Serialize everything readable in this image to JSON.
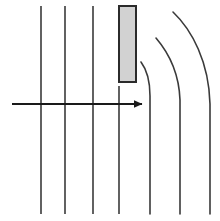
{
  "figure": {
    "width": 220,
    "height": 221,
    "background_color": "#ffffff",
    "line_color": "#3a3a3a",
    "line_width": 1.6
  },
  "plate": {
    "label": "obstacle-plate",
    "x": 119,
    "y": 6,
    "width": 17,
    "height": 76,
    "fill_color": "#d2d2d2",
    "stroke_color": "#2b2b2b",
    "stroke_width": 2
  },
  "flow_arrow": {
    "label": "flow-direction-arrow",
    "x1": 12,
    "y1": 104,
    "x2": 142,
    "y2": 104,
    "color": "#1a1a1a",
    "stroke_width": 1.8,
    "head_length": 9,
    "head_width": 8
  },
  "straight_streamlines": [
    {
      "name": "streamline-1",
      "x": 41,
      "y_top": 6,
      "y_bottom": 214
    },
    {
      "name": "streamline-2",
      "x": 65,
      "y_top": 6,
      "y_bottom": 214
    },
    {
      "name": "streamline-3",
      "x": 93,
      "y_top": 6,
      "y_bottom": 214
    },
    {
      "name": "streamline-4",
      "x": 119,
      "y_top": 86,
      "y_bottom": 214
    }
  ],
  "curved_streamlines": [
    {
      "name": "curved-streamline-1",
      "path": "M 141 62 C 147 70, 150 82, 150 96 L 150 214",
      "start_x": 141,
      "start_y": 62,
      "end_x": 150,
      "end_y": 214
    },
    {
      "name": "curved-streamline-2",
      "path": "M 156 38 C 168 52, 179 72, 180 100 L 180 214",
      "start_x": 156,
      "start_y": 38,
      "end_x": 180,
      "end_y": 214
    },
    {
      "name": "curved-streamline-3",
      "path": "M 173 12 C 192 30, 209 62, 210 104 L 210 214",
      "start_x": 173,
      "start_y": 12,
      "end_x": 210,
      "end_y": 214
    }
  ],
  "chart_data": {
    "type": "line",
    "xlabel": "",
    "ylabel": "",
    "xlim": [
      0,
      220
    ],
    "ylim": [
      221,
      0
    ],
    "grid": false,
    "legend": "none",
    "series": [
      {
        "name": "streamline-1",
        "x": [
          41,
          41
        ],
        "y": [
          6,
          214
        ]
      },
      {
        "name": "streamline-2",
        "x": [
          65,
          65
        ],
        "y": [
          6,
          214
        ]
      },
      {
        "name": "streamline-3",
        "x": [
          93,
          93
        ],
        "y": [
          6,
          214
        ]
      },
      {
        "name": "streamline-4",
        "x": [
          119,
          119
        ],
        "y": [
          86,
          214
        ]
      },
      {
        "name": "curved-streamline-1",
        "x": [
          141,
          146,
          150,
          150
        ],
        "y": [
          62,
          74,
          96,
          214
        ]
      },
      {
        "name": "curved-streamline-2",
        "x": [
          156,
          170,
          180,
          180
        ],
        "y": [
          38,
          60,
          100,
          214
        ]
      },
      {
        "name": "curved-streamline-3",
        "x": [
          173,
          196,
          210,
          210
        ],
        "y": [
          12,
          48,
          104,
          214
        ]
      },
      {
        "name": "flow-direction-arrow",
        "x": [
          12,
          142
        ],
        "y": [
          104,
          104
        ]
      }
    ],
    "annotations": [
      {
        "name": "obstacle-plate",
        "type": "rectangle",
        "x": 119,
        "y": 6,
        "width": 17,
        "height": 76,
        "fill": "#d2d2d2"
      }
    ]
  }
}
